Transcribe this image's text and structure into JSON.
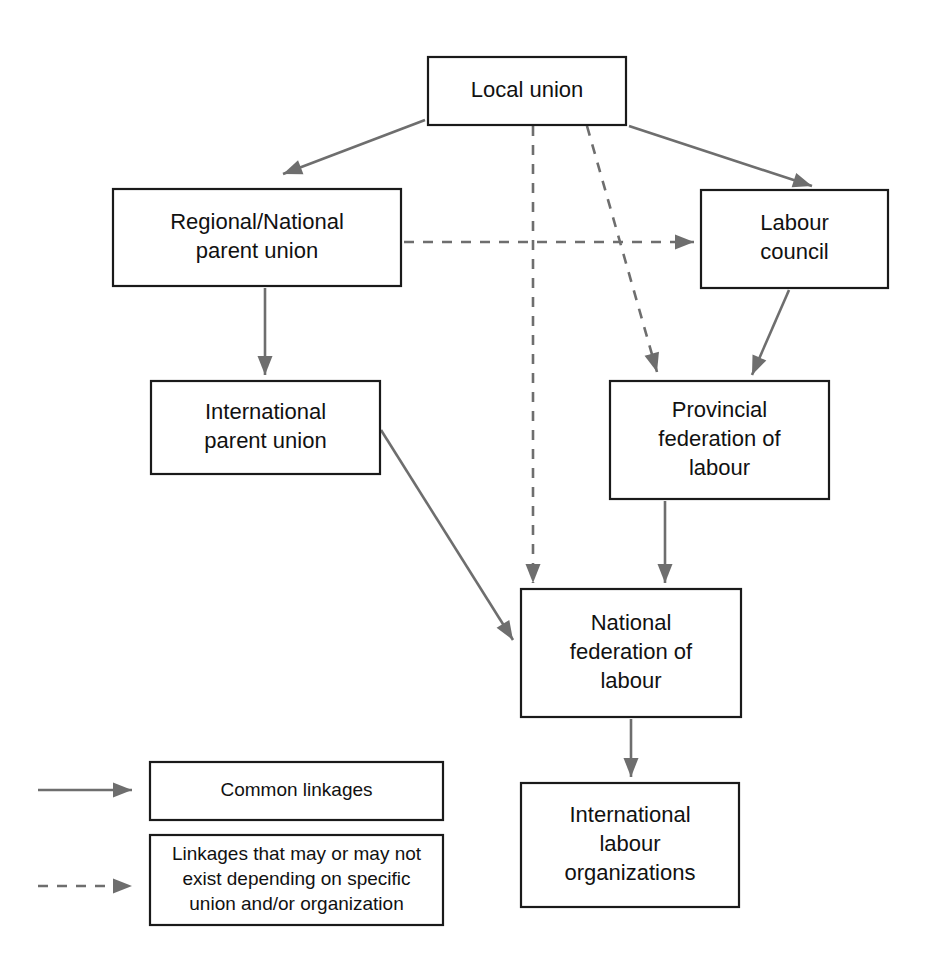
{
  "diagram": {
    "colors": {
      "box_border": "#1a1a1a",
      "line": "#6e6e6e",
      "text": "#111111",
      "background": "#ffffff"
    },
    "nodes": [
      {
        "id": "local-union",
        "lines": [
          "Local union"
        ],
        "x": 428,
        "y": 57,
        "w": 198,
        "h": 68
      },
      {
        "id": "regional-national-parent-union",
        "lines": [
          "Regional/National",
          "parent union"
        ],
        "x": 113,
        "y": 189,
        "w": 288,
        "h": 97
      },
      {
        "id": "labour-council",
        "lines": [
          "Labour",
          "council"
        ],
        "x": 701,
        "y": 190,
        "w": 187,
        "h": 98
      },
      {
        "id": "international-parent-union",
        "lines": [
          "International",
          "parent union"
        ],
        "x": 151,
        "y": 381,
        "w": 229,
        "h": 93
      },
      {
        "id": "provincial-federation-of-labour",
        "lines": [
          "Provincial",
          "federation of",
          "labour"
        ],
        "x": 610,
        "y": 381,
        "w": 219,
        "h": 118
      },
      {
        "id": "national-federation-of-labour",
        "lines": [
          "National",
          "federation of",
          "labour"
        ],
        "x": 521,
        "y": 589,
        "w": 220,
        "h": 128
      },
      {
        "id": "international-labour-organizations",
        "lines": [
          "International",
          "labour",
          "organizations"
        ],
        "x": 521,
        "y": 783,
        "w": 218,
        "h": 124
      }
    ],
    "edges": [
      {
        "id": "local-union-to-regional-national",
        "style": "solid",
        "from": "local-union",
        "to": "regional-national-parent-union",
        "points": "425,120 283,174",
        "head_angle": 159
      },
      {
        "id": "local-union-to-labour-council",
        "style": "solid",
        "from": "local-union",
        "to": "labour-council",
        "points": "629,126 812,186",
        "head_angle": 18
      },
      {
        "id": "local-union-to-national-federation",
        "style": "dashed",
        "from": "local-union",
        "to": "national-federation-of-labour",
        "points": "533,126 533,583",
        "head_angle": 90
      },
      {
        "id": "local-union-to-provincial-federation",
        "style": "dashed",
        "from": "local-union",
        "to": "provincial-federation-of-labour",
        "points": "587,126 657,372",
        "head_angle": 74
      },
      {
        "id": "regional-national-to-labour-council",
        "style": "dashed",
        "from": "regional-national-parent-union",
        "to": "labour-council",
        "points": "404,242 694,242",
        "head_angle": 0
      },
      {
        "id": "regional-national-to-international-parent",
        "style": "solid",
        "from": "regional-national-parent-union",
        "to": "international-parent-union",
        "points": "265,288 265,375",
        "head_angle": 90
      },
      {
        "id": "labour-council-to-provincial-federation",
        "style": "solid",
        "from": "labour-council",
        "to": "provincial-federation-of-labour",
        "points": "789,290 752,375",
        "head_angle": 113
      },
      {
        "id": "international-parent-to-national-federation",
        "style": "solid",
        "from": "international-parent-union",
        "to": "national-federation-of-labour",
        "points": "381,430 513,640",
        "head_angle": 58
      },
      {
        "id": "provincial-federation-to-national-federation",
        "style": "solid",
        "from": "provincial-federation-of-labour",
        "to": "national-federation-of-labour",
        "points": "665,501 665,583",
        "head_angle": 90
      },
      {
        "id": "national-federation-to-international-labour-orgs",
        "style": "solid",
        "from": "national-federation-of-labour",
        "to": "international-labour-organizations",
        "points": "631,719 631,777",
        "head_angle": 90
      }
    ],
    "legend": {
      "items": [
        {
          "id": "common-linkages",
          "style": "solid",
          "sample": "38,790 132,790",
          "head_angle": 0,
          "box": {
            "x": 150,
            "y": 762,
            "w": 293,
            "h": 58
          },
          "lines": [
            "Common linkages"
          ]
        },
        {
          "id": "conditional-linkages",
          "style": "dashed",
          "sample": "38,886 132,886",
          "head_angle": 0,
          "box": {
            "x": 150,
            "y": 835,
            "w": 293,
            "h": 90
          },
          "lines": [
            "Linkages that may or may not",
            "exist depending on specific",
            "union and/or organization"
          ]
        }
      ]
    }
  }
}
